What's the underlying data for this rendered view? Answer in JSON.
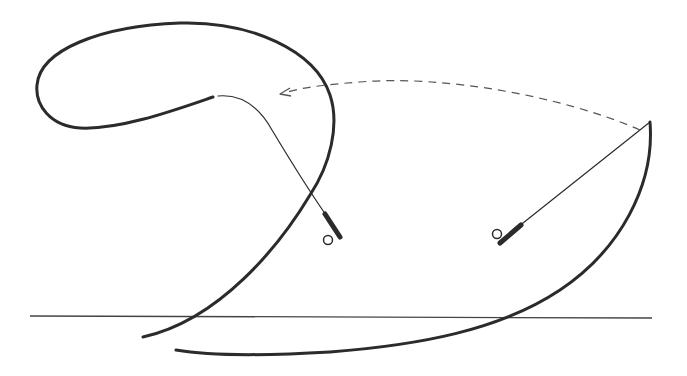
{
  "diagram": {
    "title": "",
    "description_visible_text": "",
    "colors": {
      "background": "#ffffff",
      "line": "#2b2b2b",
      "dashed_arrow": "#555555",
      "horizon": "#444444"
    },
    "elements": {
      "back_cast_rod": {
        "icon": "fly-rod-icon",
        "position": "left",
        "handle_at": [
          331,
          225
        ],
        "tip_at": [
          218,
          96
        ]
      },
      "forward_cast_rod": {
        "icon": "fly-rod-icon",
        "position": "right",
        "handle_at": [
          509,
          235
        ],
        "tip_at": [
          650,
          122
        ]
      },
      "loop_line": {
        "label": "",
        "shape": "open loop"
      },
      "forward_line": {
        "label": "",
        "shape": "sweeping arc"
      },
      "motion_arrow": {
        "style": "dashed",
        "direction": "right-to-left"
      },
      "horizon": {
        "y": 317
      }
    }
  }
}
